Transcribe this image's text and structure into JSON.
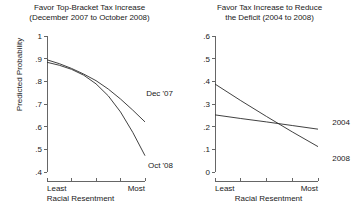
{
  "figure": {
    "panels": [
      {
        "name": "top-bracket-tax-increase",
        "title": "Favor Top-Bracket Tax Increase\n(December 2007 to October 2008)",
        "ylabel": "Predicted Probability",
        "xlabel": "Racial Resentment",
        "yticks": [
          "1",
          ".9",
          ".8",
          ".7",
          ".6",
          ".5",
          ".4"
        ],
        "xticks": [
          "Least",
          "Most"
        ],
        "series_labels": [
          "Dec '07",
          "Oct '08"
        ]
      },
      {
        "name": "tax-increase-reduce-deficit",
        "title": "Favor Tax Increase to Reduce\nthe Deficit (2004 to 2008)",
        "ylabel": "",
        "xlabel": "Racial Resentment",
        "yticks": [
          ".6",
          ".5",
          ".4",
          ".3",
          ".2",
          ".1",
          "0"
        ],
        "xticks": [
          "Least",
          "Most"
        ],
        "series_labels": [
          "2004",
          "2008"
        ]
      }
    ],
    "colors": {
      "line": "#2b2b2b",
      "axis": "#555555",
      "text": "#1a1a1a",
      "background": "#ffffff"
    }
  },
  "chart_data": [
    {
      "type": "line",
      "title": "Favor Top-Bracket Tax Increase (December 2007 to October 2008)",
      "xlabel": "Racial Resentment",
      "ylabel": "Predicted Probability",
      "xlim": [
        0,
        1
      ],
      "ylim": [
        0.4,
        1.0
      ],
      "yticks": [
        0.4,
        0.5,
        0.6,
        0.7,
        0.8,
        0.9,
        1.0
      ],
      "ytick_labels": [
        ".4",
        ".5",
        ".6",
        ".7",
        ".8",
        ".9",
        "1"
      ],
      "xtick_positions": [
        0,
        0.25,
        0.5,
        0.75,
        1
      ],
      "xtick_labels": [
        "Least",
        "",
        "",
        "",
        "Most"
      ],
      "grid": false,
      "legend": "inline-annotations",
      "series": [
        {
          "name": "Dec '07",
          "x": [
            0,
            0.125,
            0.25,
            0.375,
            0.5,
            0.625,
            0.75,
            0.875,
            1
          ],
          "values": [
            0.895,
            0.878,
            0.857,
            0.832,
            0.803,
            0.766,
            0.722,
            0.673,
            0.621
          ]
        },
        {
          "name": "Oct '08",
          "x": [
            0,
            0.125,
            0.25,
            0.375,
            0.5,
            0.625,
            0.75,
            0.875,
            1
          ],
          "values": [
            0.884,
            0.871,
            0.853,
            0.827,
            0.789,
            0.736,
            0.665,
            0.575,
            0.472
          ]
        }
      ]
    },
    {
      "type": "line",
      "title": "Favor Tax Increase to Reduce the Deficit (2004 to 2008)",
      "xlabel": "Racial Resentment",
      "ylabel": "Predicted Probability",
      "xlim": [
        0,
        1
      ],
      "ylim": [
        0.0,
        0.6
      ],
      "yticks": [
        0.0,
        0.1,
        0.2,
        0.3,
        0.4,
        0.5,
        0.6
      ],
      "ytick_labels": [
        "0",
        ".1",
        ".2",
        ".3",
        ".4",
        ".5",
        ".6"
      ],
      "xtick_positions": [
        0,
        0.25,
        0.5,
        0.75,
        1
      ],
      "xtick_labels": [
        "Least",
        "",
        "",
        "",
        "Most"
      ],
      "grid": false,
      "legend": "inline-annotations",
      "series": [
        {
          "name": "2004",
          "x": [
            0,
            0.25,
            0.5,
            0.75,
            1
          ],
          "values": [
            0.252,
            0.236,
            0.221,
            0.205,
            0.189
          ]
        },
        {
          "name": "2008",
          "x": [
            0,
            0.25,
            0.5,
            0.75,
            1
          ],
          "values": [
            0.388,
            0.315,
            0.245,
            0.177,
            0.112
          ]
        }
      ]
    }
  ]
}
